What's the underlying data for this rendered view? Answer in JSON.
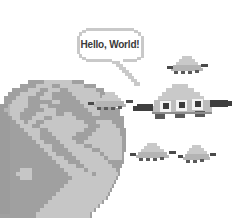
{
  "scene": {
    "title": "Hello, World! pixel-art illustration",
    "width": 233,
    "height": 218,
    "background_color": "#ffffff"
  },
  "speech_bubble": {
    "text": "Hello, World!",
    "outline_color": "#c9c9c9",
    "fill_color": "#ffffff",
    "text_color": "#3a3a3a",
    "tail_color": "#c9c9c9"
  },
  "globe": {
    "label": "Earth",
    "ocean_color": "#a0a0a0",
    "land_color": "#c6c6c6",
    "shadow_color": "#8f8f8f"
  },
  "ufos": [
    {
      "id": "ufo-large",
      "label": "Large UFO mothership",
      "dome_color": "#c9c9c9",
      "hull_color": "#b0b0b0",
      "wing_color": "#4a4a4a",
      "window_color": "#f2f2f2",
      "window_inner_color": "#3a3a3a",
      "pod_color": "#5a5a5a"
    },
    {
      "id": "ufo-speaker",
      "label": "Speaking UFO near globe",
      "dome_color": "#c9c9c9",
      "hull_color": "#b0b0b0",
      "wing_color": "#4a4a4a"
    },
    {
      "id": "ufo-top-right",
      "label": "Small UFO top right",
      "dome_color": "#c9c9c9",
      "hull_color": "#b0b0b0",
      "wing_color": "#4a4a4a"
    },
    {
      "id": "ufo-bottom-mid",
      "label": "Small UFO bottom middle",
      "dome_color": "#c9c9c9",
      "hull_color": "#b0b0b0",
      "wing_color": "#4a4a4a"
    },
    {
      "id": "ufo-bottom-right",
      "label": "Small UFO bottom right",
      "dome_color": "#c9c9c9",
      "hull_color": "#b0b0b0",
      "wing_color": "#4a4a4a"
    }
  ]
}
